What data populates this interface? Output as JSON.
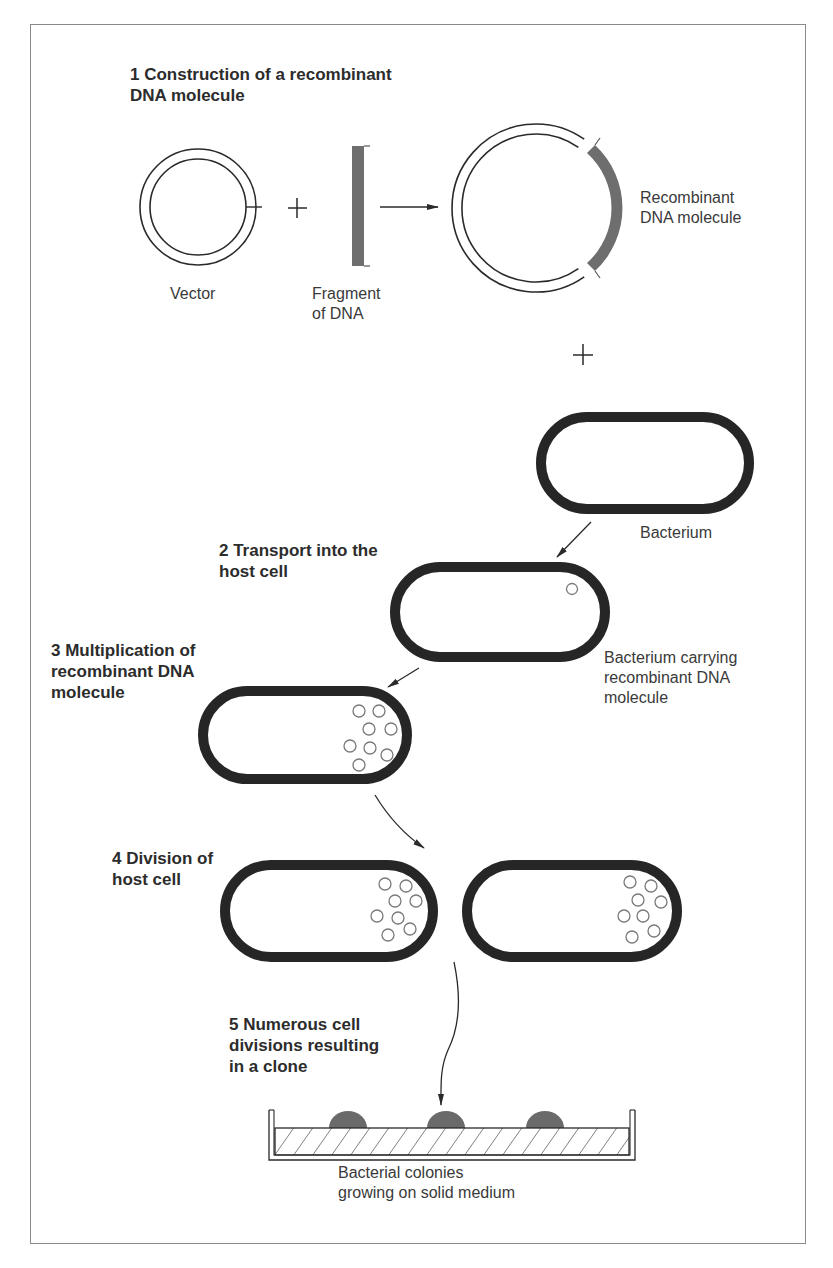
{
  "colors": {
    "ink": "#2a2a2a",
    "cell_wall": "#262626",
    "dna_fragment": "#6e6e6e",
    "plasmid_small": "#7a7a7a",
    "colony": "#6a6a6a",
    "frame": "#8a8a8a"
  },
  "steps": [
    {
      "number": "1",
      "title": "1  Construction of a recombinant\nDNA molecule"
    },
    {
      "number": "2",
      "title": "2  Transport into the\nhost cell"
    },
    {
      "number": "3",
      "title": "3  Multiplication of\nrecombinant DNA\nmolecule"
    },
    {
      "number": "4",
      "title": "4  Division of\nhost cell"
    },
    {
      "number": "5",
      "title": "5  Numerous cell\ndivisions resulting\nin a clone"
    }
  ],
  "labels": {
    "vector": "Vector",
    "fragment": "Fragment\nof DNA",
    "recombinant": "Recombinant\nDNA molecule",
    "bacterium": "Bacterium",
    "bacterium_carrying": "Bacterium carrying\nrecombinant DNA\nmolecule",
    "colonies": "Bacterial colonies\ngrowing on solid medium"
  },
  "symbols": {
    "plus": "+",
    "arrow": "→"
  },
  "counts": {
    "plasmids_in_cell_step2": 1,
    "plasmids_in_cell_step3": 8,
    "plasmids_per_daughter_cell_step4": 8,
    "colonies_on_plate": 3
  }
}
